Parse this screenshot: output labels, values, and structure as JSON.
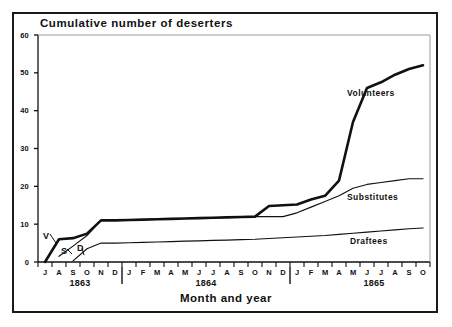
{
  "figure": {
    "title": "Cumulative number of deserters",
    "axis_title": "Month and year"
  },
  "chart_data": {
    "type": "line",
    "title": "Cumulative number of deserters",
    "xlabel": "Month and year",
    "ylabel": "",
    "ylim": [
      0,
      60
    ],
    "yticks": [
      0,
      10,
      20,
      30,
      40,
      50,
      60
    ],
    "grid": false,
    "legend_position": "inline-right",
    "x_tick_labels": [
      "J",
      "A",
      "S",
      "O",
      "N",
      "D",
      "J",
      "F",
      "M",
      "A",
      "M",
      "J",
      "J",
      "A",
      "S",
      "O",
      "N",
      "D",
      "J",
      "F",
      "M",
      "A",
      "M",
      "J",
      "J",
      "A",
      "S",
      "O"
    ],
    "x_full_labels": [
      "Jul 1863",
      "Aug 1863",
      "Sep 1863",
      "Oct 1863",
      "Nov 1863",
      "Dec 1863",
      "Jan 1864",
      "Feb 1864",
      "Mar 1864",
      "Apr 1864",
      "May 1864",
      "Jun 1864",
      "Jul 1864",
      "Aug 1864",
      "Sep 1864",
      "Oct 1864",
      "Nov 1864",
      "Dec 1864",
      "Jan 1865",
      "Feb 1865",
      "Mar 1865",
      "Apr 1865",
      "May 1865",
      "Jun 1865",
      "Jul 1865",
      "Aug 1865",
      "Sep 1865",
      "Oct 1865"
    ],
    "year_groups": [
      {
        "label": "1863",
        "center_index": 2.5
      },
      {
        "label": "1864",
        "center_index": 11.5
      },
      {
        "label": "1865",
        "center_index": 23.5
      }
    ],
    "series": [
      {
        "name": "Volunteers",
        "marker_label": "V",
        "line_weight": "thick",
        "start_index": 0,
        "values": [
          0,
          6,
          6.3,
          7.5,
          11,
          11,
          11.1,
          11.2,
          11.3,
          11.4,
          11.5,
          11.6,
          11.7,
          11.8,
          11.9,
          12,
          14.8,
          15,
          15.2,
          16.5,
          17.5,
          21.5,
          37,
          46,
          47.5,
          49.5,
          51,
          52
        ]
      },
      {
        "name": "Substitutes",
        "marker_label": "S",
        "line_weight": "thin",
        "start_index": 1,
        "values": [
          null,
          1.5,
          4.2,
          7,
          11,
          11,
          11.1,
          11.2,
          11.3,
          11.4,
          11.5,
          11.6,
          11.7,
          11.8,
          11.9,
          12,
          12,
          12,
          13,
          14.5,
          16,
          17.5,
          19.5,
          20.5,
          21,
          21.5,
          22,
          22
        ]
      },
      {
        "name": "Draftees",
        "marker_label": "D",
        "line_weight": "thin",
        "start_index": 2,
        "values": [
          null,
          null,
          0.3,
          3.5,
          5,
          5,
          5.1,
          5.2,
          5.3,
          5.4,
          5.5,
          5.6,
          5.7,
          5.8,
          5.9,
          6.0,
          6.2,
          6.4,
          6.6,
          6.8,
          7.0,
          7.3,
          7.6,
          7.9,
          8.2,
          8.5,
          8.8,
          9.0
        ]
      }
    ]
  }
}
